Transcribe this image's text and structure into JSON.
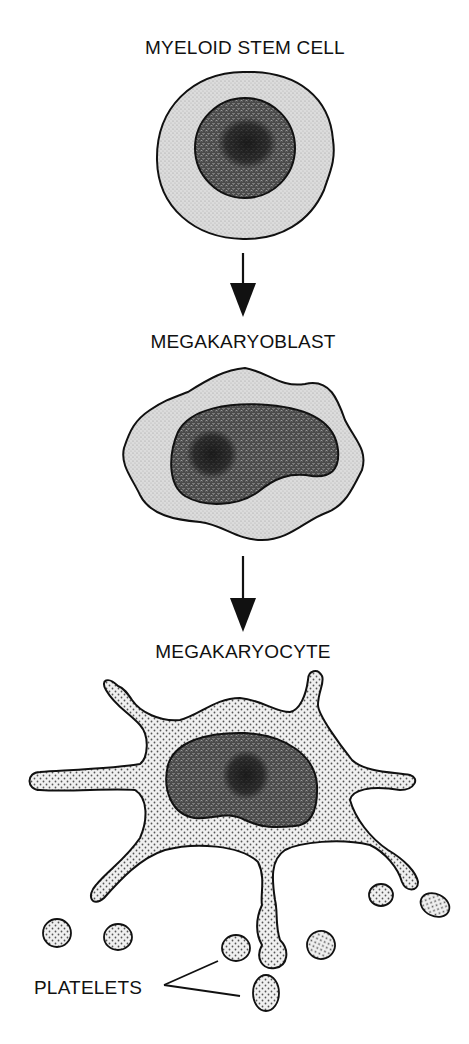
{
  "diagram": {
    "type": "cell-lineage-flow",
    "stages": [
      {
        "id": "stem",
        "label": "MYELOID STEM CELL"
      },
      {
        "id": "blast",
        "label": "MEGAKARYOBLAST"
      },
      {
        "id": "cyte",
        "label": "MEGAKARYOCYTE"
      }
    ],
    "platelets_label": "PLATELETS",
    "arrows": [
      {
        "from": "MYELOID STEM CELL",
        "to": "MEGAKARYOBLAST"
      },
      {
        "from": "MEGAKARYOBLAST",
        "to": "MEGAKARYOCYTE"
      }
    ],
    "colors": {
      "outline": "#111111",
      "cytoplasm_light": "#d9d9d9",
      "cytoplasm_dotted": "#ececec",
      "nucleus": "#5a5a5a",
      "nucleolus": "#2a2a2a",
      "background": "#ffffff"
    }
  }
}
